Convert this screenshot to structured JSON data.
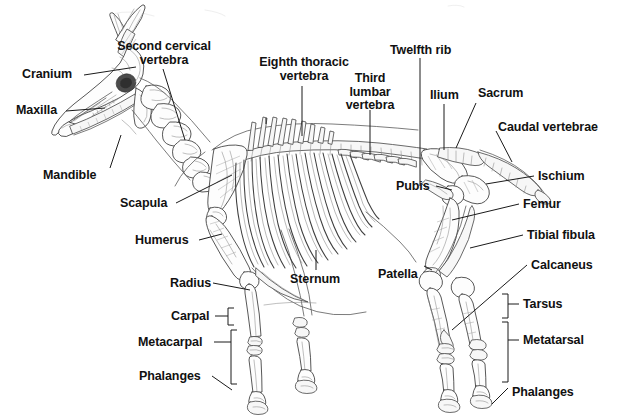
{
  "diagram": {
    "view": "lateral-left",
    "background_color": "#ffffff",
    "line_color": "#2b2b2b",
    "label_color": "#111111",
    "leader_line_color": "#1a1a1a"
  },
  "labels": {
    "cranium": "Cranium",
    "maxilla": "Maxilla",
    "mandible": "Mandible",
    "second_cervical_vertebra": "Second cervical\nvertebra",
    "eighth_thoracic_vertebra": "Eighth thoracic\nvertebra",
    "third_lumbar_vertebra": "Third\nlumbar\nvertebra",
    "twelfth_rib": "Twelfth rib",
    "ilium": "Ilium",
    "sacrum": "Sacrum",
    "caudal_vertebrae": "Caudal vertebrae",
    "ischium": "Ischium",
    "femur": "Femur",
    "tibial_fibula": "Tibial fibula",
    "calcaneus": "Calcaneus",
    "tarsus": "Tarsus",
    "metatarsal": "Metatarsal",
    "phalanges_hind": "Phalanges",
    "pubis": "Pubis",
    "patella": "Patella",
    "sternum": "Sternum",
    "scapula": "Scapula",
    "humerus": "Humerus",
    "radius": "Radius",
    "carpal": "Carpal",
    "metacarpal": "Metacarpal",
    "phalanges_fore": "Phalanges"
  },
  "label_list": [
    {
      "id": "cranium",
      "text": "Cranium",
      "x": 22,
      "y": 68,
      "align": "left"
    },
    {
      "id": "maxilla",
      "text": "Maxilla",
      "x": 16,
      "y": 104,
      "align": "left"
    },
    {
      "id": "mandible",
      "text": "Mandible",
      "x": 43,
      "y": 169,
      "align": "left"
    },
    {
      "id": "second-cervical-vertebra",
      "text": "Second cervical vertebra",
      "x": 160,
      "y": 40,
      "align": "center"
    },
    {
      "id": "eighth-thoracic-vertebra",
      "text": "Eighth thoracic vertebra",
      "x": 258,
      "y": 55,
      "align": "center"
    },
    {
      "id": "third-lumbar-vertebra",
      "text": "Third lumbar vertebra",
      "x": 362,
      "y": 72,
      "align": "center"
    },
    {
      "id": "twelfth-rib",
      "text": "Twelfth rib",
      "x": 390,
      "y": 44,
      "align": "left"
    },
    {
      "id": "ilium",
      "text": "Ilium",
      "x": 430,
      "y": 89,
      "align": "left"
    },
    {
      "id": "sacrum",
      "text": "Sacrum",
      "x": 478,
      "y": 87,
      "align": "left"
    },
    {
      "id": "caudal-vertebrae",
      "text": "Caudal vertebrae",
      "x": 498,
      "y": 121,
      "align": "left"
    },
    {
      "id": "ischium",
      "text": "Ischium",
      "x": 538,
      "y": 170,
      "align": "left"
    },
    {
      "id": "femur",
      "text": "Femur",
      "x": 523,
      "y": 198,
      "align": "left"
    },
    {
      "id": "tibial-fibula",
      "text": "Tibial fibula",
      "x": 527,
      "y": 229,
      "align": "left"
    },
    {
      "id": "calcaneus",
      "text": "Calcaneus",
      "x": 531,
      "y": 259,
      "align": "left"
    },
    {
      "id": "tarsus",
      "text": "Tarsus",
      "x": 523,
      "y": 298,
      "align": "left"
    },
    {
      "id": "metatarsal",
      "text": "Metatarsal",
      "x": 523,
      "y": 334,
      "align": "left"
    },
    {
      "id": "phalanges-hind",
      "text": "Phalanges",
      "x": 512,
      "y": 386,
      "align": "left"
    },
    {
      "id": "pubis",
      "text": "Pubis",
      "x": 396,
      "y": 180,
      "align": "left"
    },
    {
      "id": "patella",
      "text": "Patella",
      "x": 378,
      "y": 268,
      "align": "left"
    },
    {
      "id": "sternum",
      "text": "Sternum",
      "x": 290,
      "y": 273,
      "align": "left"
    },
    {
      "id": "scapula",
      "text": "Scapula",
      "x": 120,
      "y": 197,
      "align": "left"
    },
    {
      "id": "humerus",
      "text": "Humerus",
      "x": 135,
      "y": 234,
      "align": "left"
    },
    {
      "id": "radius",
      "text": "Radius",
      "x": 170,
      "y": 277,
      "align": "left"
    },
    {
      "id": "carpal",
      "text": "Carpal",
      "x": 171,
      "y": 310,
      "align": "left"
    },
    {
      "id": "metacarpal",
      "text": "Metacarpal",
      "x": 138,
      "y": 336,
      "align": "left"
    },
    {
      "id": "phalanges-fore",
      "text": "Phalanges",
      "x": 139,
      "y": 370,
      "align": "left"
    }
  ]
}
